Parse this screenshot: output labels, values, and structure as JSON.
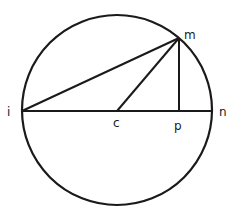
{
  "diagram": {
    "type": "circle-geometry",
    "colors": {
      "stroke": "#1a1a1a",
      "background": "#ffffff"
    },
    "circle": {
      "cx": 117,
      "cy": 110,
      "r": 95
    },
    "points": {
      "i": {
        "label": "i",
        "x": 22,
        "y": 111
      },
      "n": {
        "label": "n",
        "x": 212,
        "y": 111
      },
      "c": {
        "label": "c",
        "x": 117,
        "y": 111
      },
      "p": {
        "label": "p",
        "x": 179,
        "y": 111
      },
      "m": {
        "label": "m",
        "x": 179,
        "y": 38
      }
    },
    "segments": [
      {
        "from": "i",
        "to": "n",
        "name": "diameter-in"
      },
      {
        "from": "i",
        "to": "m",
        "name": "chord-im"
      },
      {
        "from": "c",
        "to": "m",
        "name": "radius-cm"
      },
      {
        "from": "m",
        "to": "p",
        "name": "perpendicular-mp"
      }
    ]
  }
}
